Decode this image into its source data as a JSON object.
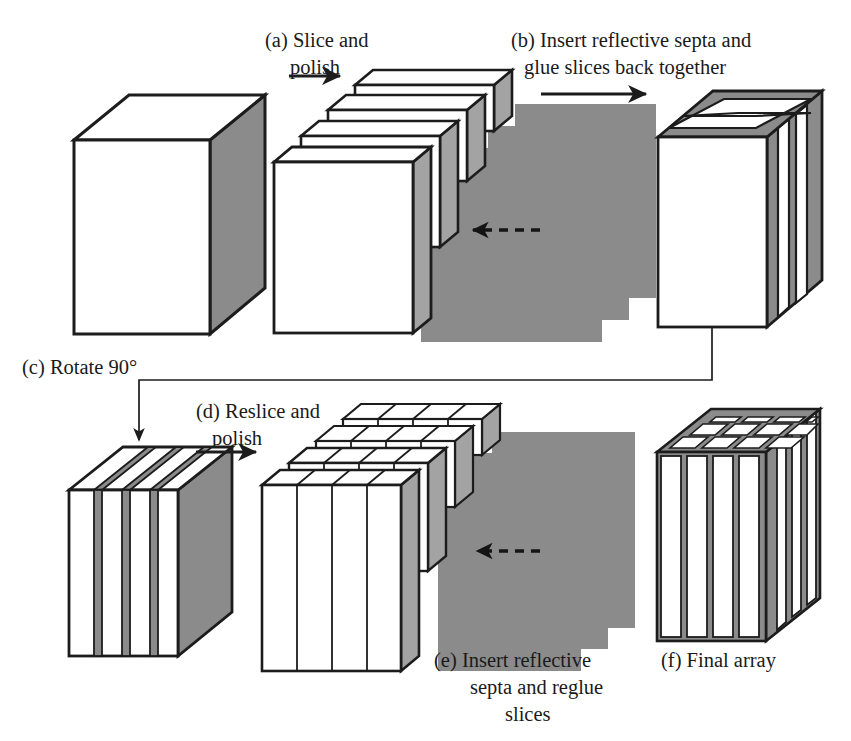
{
  "figure": {
    "background_color": "#ffffff",
    "ink_color": "#1c1c1c",
    "septa_color": "#8b8b8b",
    "crystal_color": "#ffffff"
  },
  "captions": {
    "a": {
      "line1": "(a) Slice and",
      "line2": "polish"
    },
    "b": {
      "line1": "(b) Insert reflective septa and",
      "line2": "glue slices back together"
    },
    "c": {
      "line1": "(c) Rotate 90°"
    },
    "d": {
      "line1": "(d) Reslice and",
      "line2": "polish"
    },
    "e": {
      "line1": "(e) Insert reflective",
      "line2": "septa and reglue",
      "line3": "slices"
    },
    "f": {
      "line1": "(f) Final array"
    }
  },
  "stages": [
    {
      "id": "raw-block",
      "name": "Solid scintillator block",
      "row": "top",
      "front_face": "white",
      "top_face": "white",
      "side_face": "gray",
      "slice_count": 0,
      "septa_count": 0
    },
    {
      "id": "sliced-stack-a",
      "name": "Stack of polished slices",
      "row": "top",
      "slice_count": 4,
      "septa_count": 4,
      "slice_face": "white",
      "septa_face": "gray",
      "motion_arrow": "dashed-left"
    },
    {
      "id": "reglued-block-b",
      "name": "Reglued block with horizontal septa",
      "row": "top",
      "front_face": "white",
      "top_face": "striped-horizontal",
      "side_face": "striped-vertical",
      "septa_count": 3
    },
    {
      "id": "rotated-block-c",
      "name": "Block rotated 90 degrees",
      "row": "bottom",
      "front_face": "striped-vertical",
      "top_face": "striped-diagonal",
      "side_face": "gray",
      "septa_count": 3
    },
    {
      "id": "resliced-stack-d",
      "name": "Restack of resliced septa-bearing slabs",
      "row": "bottom",
      "slice_count": 4,
      "septa_count": 3,
      "cells_per_slice_top": 4,
      "motion_arrow": "dashed-left"
    },
    {
      "id": "final-array-f",
      "name": "Final 2D scintillator array",
      "row": "bottom",
      "front_columns": 4,
      "top_grid_columns": 4,
      "top_grid_rows": 3,
      "side_stripes": 4
    }
  ],
  "arrows": [
    {
      "id": "arrow-a",
      "type": "solid-right",
      "label_ref": "a"
    },
    {
      "id": "arrow-b",
      "type": "solid-right",
      "label_ref": "b"
    },
    {
      "id": "arrow-c",
      "type": "elbow-down",
      "label_ref": "c"
    },
    {
      "id": "arrow-d",
      "type": "solid-right",
      "label_ref": "d"
    },
    {
      "id": "arrow-motion-top",
      "type": "dashed-left"
    },
    {
      "id": "arrow-motion-bottom",
      "type": "dashed-left"
    }
  ]
}
